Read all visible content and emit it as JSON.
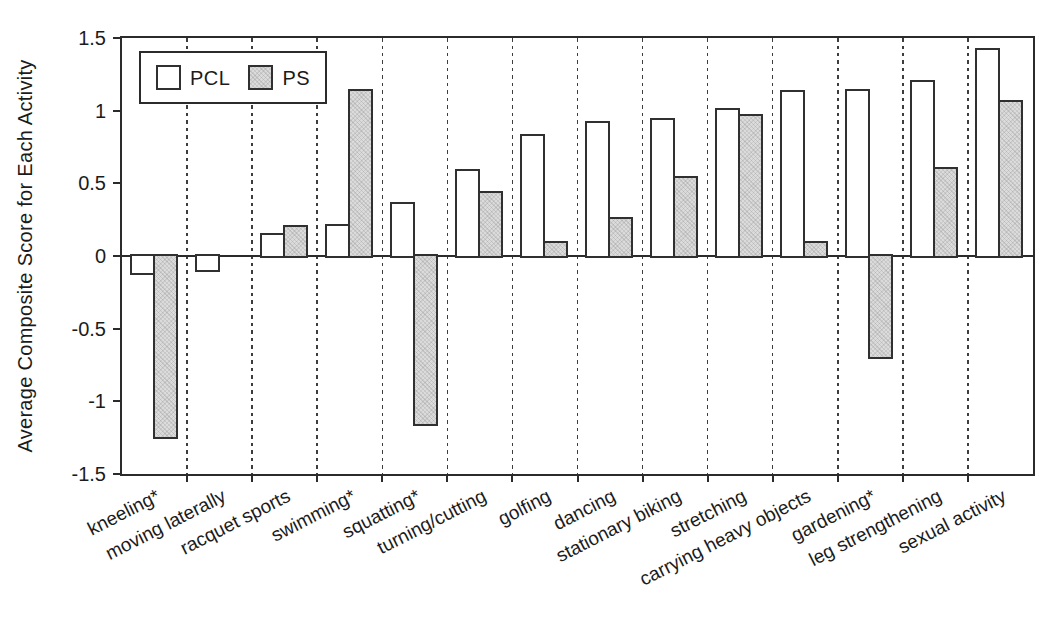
{
  "chart_data": {
    "type": "bar",
    "title": "",
    "xlabel": "",
    "ylabel": "Average Composite Score for Each Activity",
    "ylim": [
      -1.5,
      1.5
    ],
    "ytick_labels": [
      "1.5",
      "1",
      "0.5",
      "0",
      "-0.5",
      "-1",
      "-1.5"
    ],
    "grid": "dashed vertical separator lines between categories, solid zero line, full rectangular frame",
    "legend": {
      "position": "top-left inside plot",
      "entries": [
        "PCL",
        "PS"
      ]
    },
    "categories": [
      "kneeling*",
      "moving laterally",
      "racquet sports",
      "swimming*",
      "squatting*",
      "turning/cutting",
      "golfing",
      "dancing",
      "stationary biking",
      "stretching",
      "carrying heavy objects",
      "gardening*",
      "leg strengthening",
      "sexual activity"
    ],
    "series": [
      {
        "name": "PCL",
        "fill": "#ffffff",
        "values": [
          -0.13,
          -0.11,
          0.16,
          0.22,
          0.37,
          0.6,
          0.84,
          0.93,
          0.95,
          1.02,
          1.14,
          1.15,
          1.21,
          1.43
        ]
      },
      {
        "name": "PS",
        "fill": "#dbdbdb",
        "values": [
          -1.26,
          0,
          0.21,
          1.15,
          -1.17,
          0.45,
          0.1,
          0.27,
          0.55,
          0.98,
          0.1,
          -0.71,
          0.61,
          1.07
        ]
      }
    ]
  },
  "colors": {
    "axis": "#2b2b2b",
    "bar_border": "#303030",
    "gridline": "#3d3d3d",
    "text": "#1b1b1b",
    "background": "#ffffff"
  }
}
